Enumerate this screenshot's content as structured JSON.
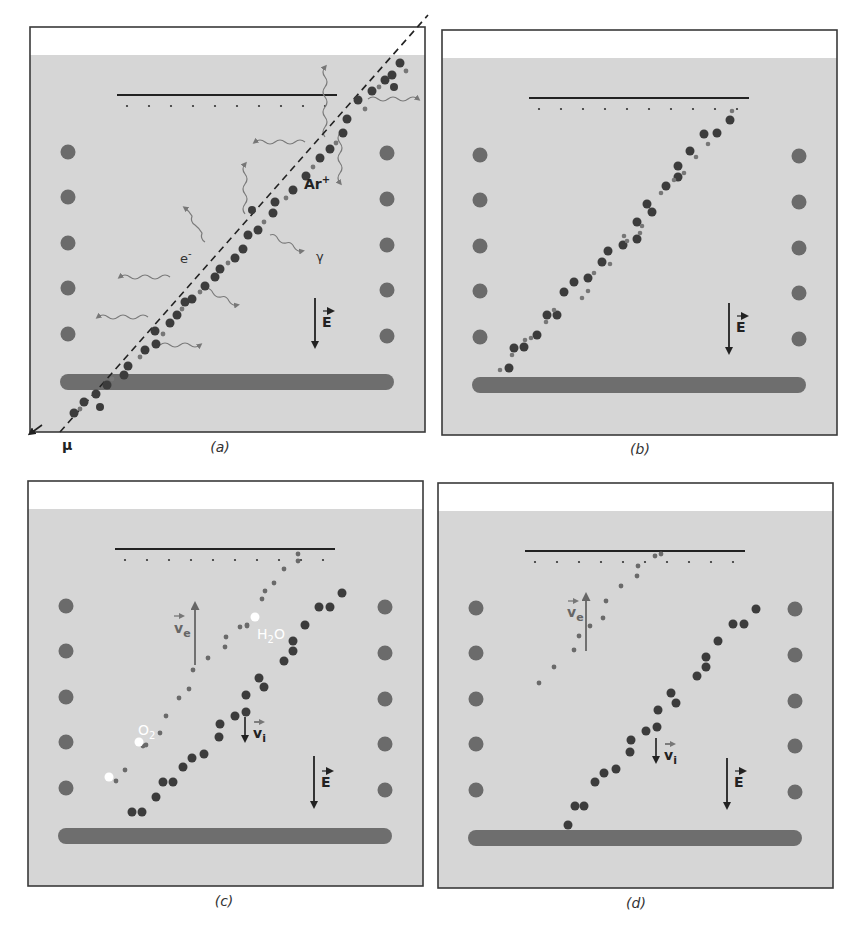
{
  "figure": {
    "colors": {
      "background": "#ffffff",
      "gas": "#d6d6d6",
      "frame": "#3a3a3a",
      "field_ring": "#6b6b6b",
      "cathode_bar": "#6e6e6e",
      "ion": "#3c3c3c",
      "electron": "#6a6a6a",
      "photon": "#707070",
      "impurity": "#ffffff",
      "readout_line": "#222222"
    },
    "panels": [
      {
        "id": "a",
        "caption": "(a)",
        "origin": [
          30,
          27
        ],
        "labels": {
          "muon": "μ",
          "ion": "Ar",
          "ion_charge": "+",
          "electron": "e",
          "electron_charge": "-",
          "photon": "γ",
          "field": "E"
        }
      },
      {
        "id": "b",
        "caption": "(b)",
        "origin": [
          442,
          30
        ],
        "labels": {
          "field": "E"
        }
      },
      {
        "id": "c",
        "caption": "(c)",
        "origin": [
          28,
          481
        ],
        "labels": {
          "electron_velocity": "v",
          "electron_velocity_sub": "e",
          "ion_velocity": "v",
          "ion_velocity_sub": "i",
          "impurity_1": "H",
          "impurity_1_sub": "2",
          "impurity_1_tail": "O",
          "impurity_2": "O",
          "impurity_2_sub": "2",
          "field": "E"
        }
      },
      {
        "id": "d",
        "caption": "(d)",
        "origin": [
          438,
          483
        ],
        "labels": {
          "electron_velocity": "v",
          "electron_velocity_sub": "e",
          "ion_velocity": "v",
          "ion_velocity_sub": "i",
          "field": "E"
        }
      }
    ]
  }
}
